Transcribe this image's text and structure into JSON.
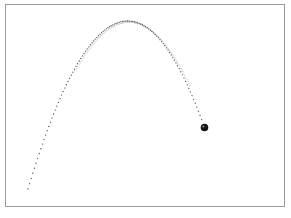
{
  "canvas": {
    "width": 291,
    "height": 218,
    "background": "#ffffff",
    "frame": {
      "x": 5.5,
      "y": 4.5,
      "width": 279,
      "height": 202,
      "stroke": "#9a9a9a",
      "stroke_width": 1,
      "fill": "#ffffff"
    }
  },
  "chart_data": {
    "type": "scatter",
    "title": "",
    "xlabel": "",
    "ylabel": "",
    "axes_visible": false,
    "grid": false,
    "legend": false,
    "units": "screen pixels",
    "trail": {
      "dot_color": "#4a4a4a",
      "dot_radius": 0.65,
      "sample_step_x": 1.6,
      "branches": [
        {
          "name": "secondary-faint-curve",
          "x_start": 75,
          "x_end": 190,
          "apex_x": 129,
          "apex_y": 22.3,
          "coeff": 0.017,
          "step": 1.0,
          "radius": 0.55,
          "color": "#bdbdbd"
        },
        {
          "name": "ascent",
          "x_start": 28,
          "x_end": 128,
          "apex_x": 128,
          "apex_y": 21,
          "coeff": 0.0168
        },
        {
          "name": "descent",
          "x_start": 128,
          "x_end": 202,
          "apex_x": 128,
          "apex_y": 21,
          "coeff": 0.0182
        }
      ]
    },
    "key_points": {
      "launch": {
        "x": 28,
        "y": 189
      },
      "apex": {
        "x": 128,
        "y": 21
      },
      "current": {
        "x": 204.5,
        "y": 127.5
      }
    },
    "ball": {
      "x": 204.5,
      "y": 127.5,
      "radius": 3.8,
      "color": "#141414",
      "highlight": {
        "x": 203.4,
        "y": 126.6,
        "radius": 1.0,
        "color": "#909090"
      }
    }
  }
}
